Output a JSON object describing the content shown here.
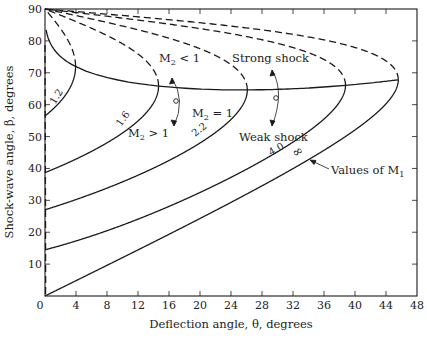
{
  "chart_data": {
    "type": "line",
    "title": "",
    "xlabel": "Deflection angle, θ, degrees",
    "ylabel": "Shock-wave angle, β, degrees",
    "xlim": [
      0,
      48
    ],
    "ylim": [
      0,
      90
    ],
    "xticks": [
      0,
      4,
      8,
      12,
      16,
      20,
      24,
      28,
      32,
      36,
      40,
      44,
      48
    ],
    "yticks": [
      0,
      10,
      20,
      30,
      40,
      50,
      60,
      70,
      80,
      90
    ],
    "grid": false,
    "gamma": 1.4,
    "series": [
      {
        "name": "M1 = 1.2",
        "label": "1.2",
        "mach": 1.2,
        "style": "solid"
      },
      {
        "name": "M1 = 1.6",
        "label": "1.6",
        "mach": 1.6,
        "style": "solid"
      },
      {
        "name": "M1 = 2.2",
        "label": "2.2",
        "mach": 2.2,
        "style": "solid"
      },
      {
        "name": "M1 = 4.0",
        "label": "4.0",
        "mach": 4.0,
        "style": "solid"
      },
      {
        "name": "M1 = ∞",
        "label": "∞",
        "mach": 1000,
        "style": "solid"
      },
      {
        "name": "M1 = 1.2 (dashed)",
        "mach": 1.2,
        "style": "dashed"
      },
      {
        "name": "M1 = 1.6 (dashed)",
        "mach": 1.6,
        "style": "dashed"
      },
      {
        "name": "M1 = 2.2 (dashed)",
        "mach": 2.2,
        "style": "dashed"
      },
      {
        "name": "M1 = 4.0 (dashed)",
        "mach": 4.0,
        "style": "dashed"
      },
      {
        "name": "M1 = ∞ (dashed)",
        "mach": 1000,
        "style": "dashed"
      }
    ],
    "locus_lines": [
      {
        "name": "Max deflection locus",
        "style": "solid"
      },
      {
        "name": "M2 = 1 (sonic line)",
        "style": "dashed"
      }
    ],
    "annotations": [
      {
        "text": "M₂ < 1",
        "id": "m2-lt-1"
      },
      {
        "text": "M₂ = 1",
        "id": "m2-eq-1"
      },
      {
        "text": "M₂ > 1",
        "id": "m2-gt-1"
      },
      {
        "text": "Strong shock",
        "id": "strong-shock"
      },
      {
        "text": "Weak shock",
        "id": "weak-shock"
      },
      {
        "text": "Values of M₁",
        "id": "values-of-m1"
      }
    ]
  },
  "labels": {
    "xlabel": "Deflection angle, θ, degrees",
    "ylabel": "Shock-wave angle, β, degrees",
    "m2_lt_1": "M",
    "m2_lt_1_sub": "2",
    "m2_lt_1_rest": " < 1",
    "m2_eq_1": "M",
    "m2_eq_1_sub": "2",
    "m2_eq_1_rest": " = 1",
    "m2_gt_1": "M",
    "m2_gt_1_sub": "2",
    "m2_gt_1_rest": " > 1",
    "strong_shock": "Strong shock",
    "weak_shock": "Weak shock",
    "values_of_m1": "Values of M",
    "values_of_m1_sub": "1",
    "curve_1_2": "1.2",
    "curve_1_6": "1.6",
    "curve_2_2": "2.2",
    "curve_4_0": "4.0",
    "curve_inf": "∞"
  },
  "colors": {
    "ink": "#1a1a1a",
    "background": "#ffffff"
  }
}
